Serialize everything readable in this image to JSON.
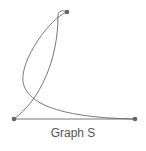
{
  "caption": "Graph S",
  "colors": {
    "edge": "#555555",
    "node": "#666666"
  },
  "nodes": [
    {
      "id": "top",
      "x": 67,
      "y": 12
    },
    {
      "id": "bottom-left",
      "x": 14,
      "y": 119
    },
    {
      "id": "bottom-right",
      "x": 135,
      "y": 119
    }
  ],
  "edges": [
    {
      "from": "bottom-left",
      "to": "bottom-right",
      "type": "straight"
    },
    {
      "from": "bottom-left",
      "to": "top",
      "type": "curve"
    },
    {
      "from": "top",
      "to": "bottom-right",
      "type": "loop-curve"
    }
  ]
}
